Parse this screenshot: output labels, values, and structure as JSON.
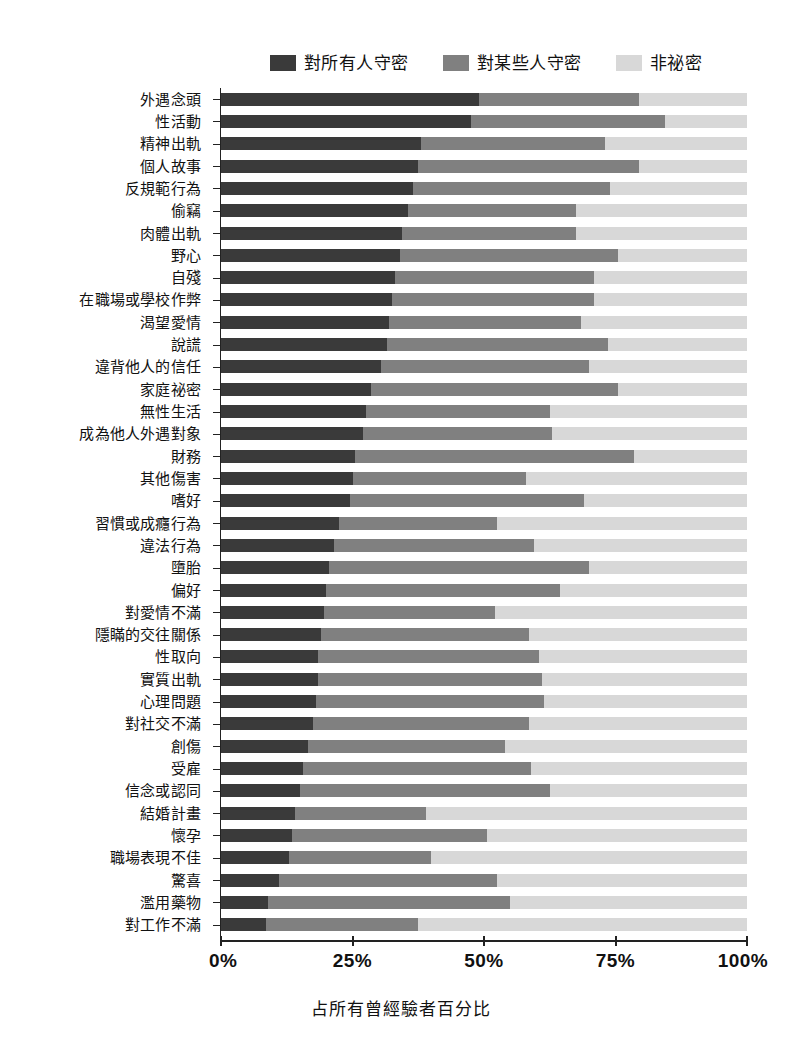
{
  "chart_data": {
    "type": "bar",
    "subtype": "horizontal-stacked-100-percent",
    "title": "",
    "xlabel": "占所有曾經驗者百分比",
    "ylabel": "",
    "xlim": [
      0,
      100
    ],
    "xticks": [
      0,
      25,
      50,
      75,
      100
    ],
    "xticklabels": [
      "0%",
      "25%",
      "50%",
      "75%",
      "100%"
    ],
    "grid": false,
    "legend_position": "top-center",
    "legend": [
      "對所有人守密",
      "對某些人守密",
      "非祕密"
    ],
    "colors": {
      "secret_from_all": "#3a3a3a",
      "secret_from_some": "#808080",
      "not_secret": "#d8d8d8",
      "axis": "#222222",
      "background": "#ffffff"
    },
    "categories": [
      "外遇念頭",
      "性活動",
      "精神出軌",
      "個人故事",
      "反規範行為",
      "偷竊",
      "肉體出軌",
      "野心",
      "自殘",
      "在職場或學校作弊",
      "渴望愛情",
      "說謊",
      "違背他人的信任",
      "家庭祕密",
      "無性生活",
      "成為他人外遇對象",
      "財務",
      "其他傷害",
      "嗜好",
      "習慣或成癮行為",
      "違法行為",
      "墮胎",
      "偏好",
      "對愛情不滿",
      "隱瞞的交往關係",
      "性取向",
      "實質出軌",
      "心理問題",
      "對社交不滿",
      "創傷",
      "受雇",
      "信念或認同",
      "結婚計畫",
      "懷孕",
      "職場表現不佳",
      "驚喜",
      "濫用藥物",
      "對工作不滿"
    ],
    "series": [
      {
        "name": "對所有人守密",
        "color": "#3a3a3a",
        "values": [
          49.0,
          47.5,
          38.0,
          37.5,
          36.5,
          35.5,
          34.5,
          34.0,
          33.0,
          32.5,
          32.0,
          31.5,
          30.5,
          28.5,
          27.5,
          27.0,
          25.5,
          25.0,
          24.5,
          22.5,
          21.5,
          20.5,
          20.0,
          19.5,
          19.0,
          18.5,
          18.5,
          18.0,
          17.5,
          16.5,
          15.5,
          15.0,
          14.0,
          13.5,
          13.0,
          11.0,
          9.0,
          8.5
        ]
      },
      {
        "name": "對某些人守密",
        "color": "#808080",
        "values": [
          30.5,
          37.0,
          35.0,
          42.0,
          37.5,
          32.0,
          33.0,
          41.5,
          38.0,
          38.5,
          36.5,
          42.0,
          39.5,
          47.0,
          35.0,
          36.0,
          53.0,
          33.0,
          44.5,
          30.0,
          38.0,
          49.5,
          44.5,
          32.5,
          39.5,
          42.0,
          42.5,
          43.5,
          41.0,
          37.5,
          43.5,
          47.5,
          25.0,
          37.0,
          27.0,
          41.5,
          46.0,
          29.0
        ]
      },
      {
        "name": "非祕密",
        "color": "#d8d8d8",
        "values": [
          20.5,
          15.5,
          27.0,
          20.5,
          26.0,
          32.5,
          32.5,
          24.5,
          29.0,
          29.0,
          31.5,
          26.5,
          30.0,
          24.5,
          37.5,
          37.0,
          21.5,
          42.0,
          31.0,
          47.5,
          40.5,
          30.0,
          35.5,
          48.0,
          41.5,
          39.5,
          39.0,
          38.5,
          41.5,
          46.0,
          41.0,
          37.5,
          61.0,
          49.5,
          60.0,
          47.5,
          45.0,
          62.5
        ]
      }
    ]
  }
}
